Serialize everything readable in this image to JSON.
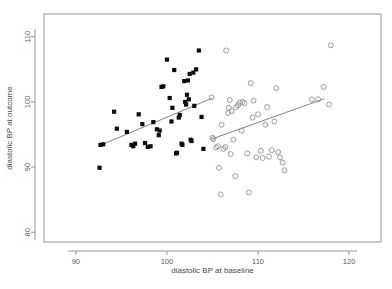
{
  "chart_data": {
    "type": "scatter",
    "title": "",
    "xlabel": "diastolic BP at baseline",
    "ylabel": "diastolic BP at outcome",
    "xlim": [
      86.5,
      123.5
    ],
    "ylim": [
      78.5,
      113.5
    ],
    "xticks": [
      90,
      100,
      110,
      120
    ],
    "yticks": [
      80,
      90,
      100,
      110
    ],
    "xtick_labels": [
      "90",
      "100",
      "110",
      "120"
    ],
    "ytick_labels": [
      "80",
      "90",
      "100",
      "110"
    ],
    "grid": false,
    "legend": "none",
    "legend_position": "none",
    "series": [
      {
        "name": "treatment group (filled squares)",
        "marker": "filled-square",
        "color": "#0d0d0d",
        "points": [
          [
            92.6,
            89.9
          ],
          [
            92.7,
            93.4
          ],
          [
            93.0,
            93.5
          ],
          [
            94.2,
            98.5
          ],
          [
            94.5,
            95.9
          ],
          [
            95.6,
            95.4
          ],
          [
            96.1,
            93.4
          ],
          [
            96.3,
            93.2
          ],
          [
            96.5,
            93.6
          ],
          [
            96.9,
            98.1
          ],
          [
            97.3,
            96.6
          ],
          [
            97.6,
            93.7
          ],
          [
            97.9,
            93.1
          ],
          [
            98.2,
            93.2
          ],
          [
            98.5,
            96.9
          ],
          [
            98.9,
            95.8
          ],
          [
            99.1,
            94.9
          ],
          [
            99.2,
            95.6
          ],
          [
            99.4,
            102.3
          ],
          [
            99.6,
            102.4
          ],
          [
            100.0,
            106.5
          ],
          [
            100.3,
            100.6
          ],
          [
            100.5,
            97.0
          ],
          [
            100.6,
            99.1
          ],
          [
            100.8,
            104.9
          ],
          [
            101.0,
            92.1
          ],
          [
            101.1,
            92.2
          ],
          [
            101.3,
            97.6
          ],
          [
            101.4,
            98.0
          ],
          [
            101.6,
            93.6
          ],
          [
            101.7,
            93.4
          ],
          [
            101.9,
            103.2
          ],
          [
            102.0,
            100.0
          ],
          [
            102.1,
            99.6
          ],
          [
            102.2,
            101.1
          ],
          [
            102.3,
            103.3
          ],
          [
            102.4,
            100.4
          ],
          [
            102.5,
            104.3
          ],
          [
            102.6,
            94.2
          ],
          [
            102.7,
            94.0
          ],
          [
            102.9,
            104.5
          ],
          [
            103.0,
            99.4
          ],
          [
            103.2,
            105.0
          ],
          [
            103.5,
            107.9
          ],
          [
            103.8,
            97.7
          ],
          [
            104.0,
            92.8
          ]
        ]
      },
      {
        "name": "control group (open circles)",
        "marker": "open-circle",
        "color": "#8d8d8d",
        "points": [
          [
            104.9,
            100.7
          ],
          [
            105.0,
            94.5
          ],
          [
            105.1,
            94.3
          ],
          [
            105.4,
            93.0
          ],
          [
            105.6,
            93.2
          ],
          [
            105.7,
            89.9
          ],
          [
            105.9,
            85.8
          ],
          [
            106.0,
            96.5
          ],
          [
            106.2,
            92.8
          ],
          [
            106.4,
            93.1
          ],
          [
            106.5,
            107.9
          ],
          [
            106.7,
            98.3
          ],
          [
            106.8,
            99.1
          ],
          [
            106.9,
            100.3
          ],
          [
            107.0,
            92.0
          ],
          [
            107.1,
            98.6
          ],
          [
            107.3,
            94.2
          ],
          [
            107.5,
            88.6
          ],
          [
            107.6,
            99.2
          ],
          [
            107.8,
            99.5
          ],
          [
            108.0,
            99.9
          ],
          [
            108.2,
            95.6
          ],
          [
            108.3,
            100.0
          ],
          [
            108.5,
            99.8
          ],
          [
            108.8,
            92.1
          ],
          [
            109.0,
            86.1
          ],
          [
            109.2,
            102.9
          ],
          [
            109.4,
            97.6
          ],
          [
            109.5,
            100.2
          ],
          [
            109.8,
            91.5
          ],
          [
            110.0,
            98.1
          ],
          [
            110.3,
            92.5
          ],
          [
            110.5,
            91.4
          ],
          [
            110.8,
            96.5
          ],
          [
            111.0,
            99.2
          ],
          [
            111.2,
            91.6
          ],
          [
            111.5,
            92.6
          ],
          [
            111.8,
            97.0
          ],
          [
            112.0,
            102.1
          ],
          [
            112.2,
            92.3
          ],
          [
            112.4,
            91.5
          ],
          [
            112.7,
            90.7
          ],
          [
            112.9,
            89.5
          ],
          [
            115.9,
            100.4
          ],
          [
            116.6,
            100.4
          ],
          [
            117.2,
            102.3
          ],
          [
            117.8,
            99.6
          ],
          [
            118.0,
            108.7
          ]
        ]
      }
    ],
    "fit_lines": [
      {
        "name": "fit-line-treatment",
        "x0": 92.6,
        "y0": 93.3,
        "x1": 105.0,
        "y1": 100.6,
        "color": "#6e6e6e"
      },
      {
        "name": "fit-line-control",
        "x0": 104.9,
        "y0": 94.3,
        "x1": 117.3,
        "y1": 100.5,
        "color": "#6e6e6e"
      }
    ]
  }
}
